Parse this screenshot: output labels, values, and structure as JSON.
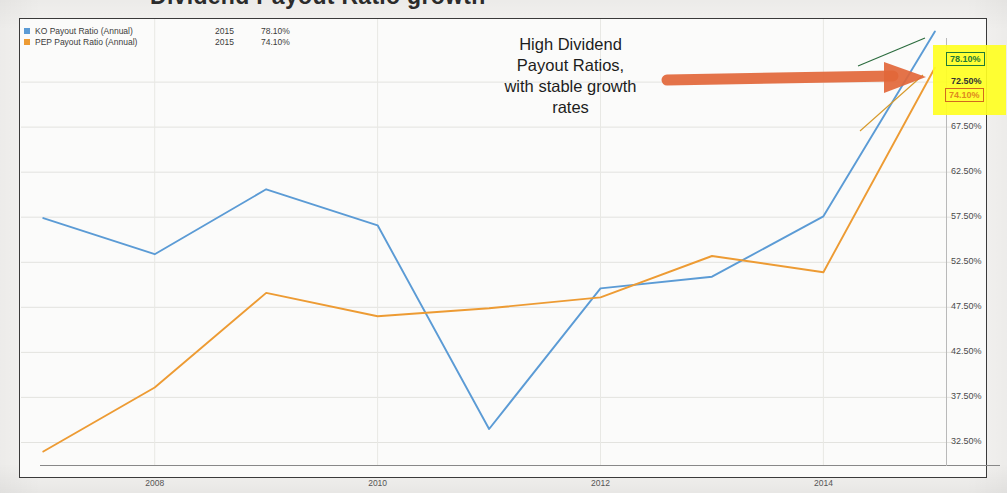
{
  "title_partial": "Dividend Payout Ratio growth",
  "legend": {
    "rows": [
      {
        "name": "KO Payout Ratio (Annual)",
        "year": "2015",
        "value": "78.10%",
        "color": "#5B9BD5",
        "swatch": "legend-swatch-ko"
      },
      {
        "name": "PEP Payout Ratio (Annual)",
        "year": "2015",
        "value": "74.10%",
        "color": "#ED9B33",
        "swatch": "legend-swatch-pep"
      }
    ]
  },
  "annotation": {
    "line1": "High Dividend",
    "line2": "Payout Ratios,",
    "line3": "with stable growth",
    "line4": "rates",
    "arrow_color": "#E2673A"
  },
  "callouts": {
    "ko": {
      "label": "78.10%",
      "color": "#1f7a36"
    },
    "pep": {
      "label": "74.10%",
      "color": "#e08a1e"
    }
  },
  "highlight_color": "#ffff22",
  "chart_data": {
    "type": "line",
    "title": "Dividend Payout Ratio growth",
    "xlabel": "",
    "ylabel": "",
    "grid": true,
    "legend_position": "top-left",
    "x": [
      2007,
      2008,
      2009,
      2010,
      2011,
      2012,
      2013,
      2014,
      2015
    ],
    "xlim": [
      2006.8,
      2015.1
    ],
    "ylim": [
      30.0,
      79.5
    ],
    "xticks": [
      "2008",
      "2010",
      "2012",
      "2014"
    ],
    "xtick_values": [
      2008,
      2010,
      2012,
      2014
    ],
    "yticks": [
      "32.50%",
      "37.50%",
      "42.50%",
      "47.50%",
      "52.50%",
      "57.50%",
      "62.50%",
      "67.50%",
      "72.50%"
    ],
    "ytick_values": [
      32.5,
      37.5,
      42.5,
      47.5,
      52.5,
      57.5,
      62.5,
      67.5,
      72.5
    ],
    "series": [
      {
        "name": "KO Payout Ratio (Annual)",
        "color": "#5B9BD5",
        "values": [
          57.4,
          53.4,
          60.6,
          56.6,
          34.0,
          49.6,
          50.9,
          57.6,
          78.1
        ],
        "final_label": "78.10%",
        "final_year": "2015"
      },
      {
        "name": "PEP Payout Ratio (Annual)",
        "color": "#ED9B33",
        "values": [
          31.5,
          38.6,
          49.1,
          46.5,
          47.4,
          48.6,
          53.2,
          51.4,
          74.1
        ],
        "final_label": "74.10%",
        "final_year": "2015"
      }
    ],
    "annotations": [
      {
        "text": "High Dividend Payout Ratios, with stable growth rates",
        "kind": "text-callout"
      },
      {
        "text": "78.10%",
        "kind": "value-box",
        "series": "KO Payout Ratio (Annual)"
      },
      {
        "text": "74.10%",
        "kind": "value-box",
        "series": "PEP Payout Ratio (Annual)"
      }
    ]
  }
}
